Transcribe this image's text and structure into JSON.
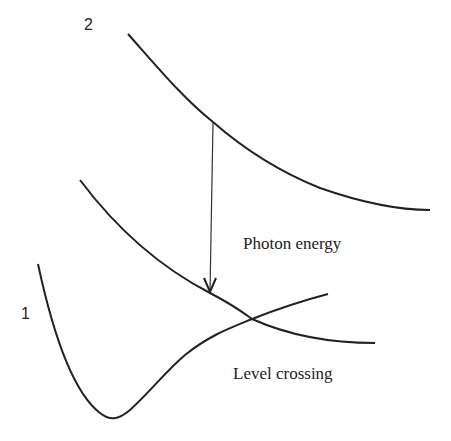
{
  "labels": {
    "upper_state": "2",
    "lower_state": "1",
    "photon_energy": "Photon energy",
    "level_crossing": "Level crossing"
  },
  "colors": {
    "stroke": "#222222",
    "background": "#ffffff"
  },
  "curves": {
    "upper_potential": "M128,34 C160,70 185,100 213,122 C245,150 280,172 320,188 C360,202 395,210 430,210",
    "repulsive_potential": "M80,180 C110,220 150,262 210,293 C235,306 245,314 252,319 C290,336 335,343 375,343",
    "bound_potential": "M38,264 C50,320 70,390 100,413 C110,421 118,420 130,410 C150,392 165,372 185,355 C210,335 230,328 252,319 C280,308 305,300 328,294"
  },
  "arrow": {
    "x1": 213,
    "y1": 123,
    "x2": 210,
    "y2": 290
  }
}
